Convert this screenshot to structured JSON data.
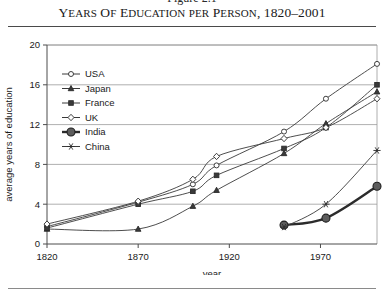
{
  "figure": {
    "number_label": "Figure 2.1",
    "title_main": "Y",
    "title_rest": "EARS OF ",
    "title_full": "YEARS OF EDUCATION PER PERSON, 1820–2001",
    "title_parts": [
      {
        "big": "Y",
        "small": "EARS"
      },
      {
        "big": " O",
        "small": "F"
      },
      {
        "big": " E",
        "small": "DUCATION"
      },
      {
        "big": " ",
        "small": "PER"
      },
      {
        "big": " P",
        "small": "ERSON"
      },
      {
        "big": ", 1820–2001",
        "small": ""
      }
    ]
  },
  "chart_data": {
    "type": "line",
    "title": "Years of Education per Person, 1820–2001",
    "xlabel": "year",
    "ylabel": "average years of education",
    "xlim": [
      1820,
      2001
    ],
    "ylim": [
      0,
      20
    ],
    "xticks": [
      1820,
      1870,
      1920,
      1970
    ],
    "yticks": [
      0,
      4,
      8,
      12,
      16,
      20
    ],
    "grid": "horizontal",
    "legend_position": "upper-left-inside",
    "series": [
      {
        "name": "USA",
        "marker": "open-circle",
        "emphasis": "normal",
        "x": [
          1820,
          1870,
          1900,
          1913,
          1950,
          1973,
          2001
        ],
        "y": [
          1.75,
          4.2,
          6.0,
          7.9,
          11.3,
          14.6,
          18.1
        ]
      },
      {
        "name": "Japan",
        "marker": "filled-triangle",
        "emphasis": "normal",
        "x": [
          1820,
          1870,
          1900,
          1913,
          1950,
          1973,
          2001
        ],
        "y": [
          1.5,
          1.5,
          3.8,
          5.4,
          9.1,
          12.1,
          15.3
        ]
      },
      {
        "name": "France",
        "marker": "filled-square",
        "emphasis": "normal",
        "x": [
          1820,
          1870,
          1900,
          1913,
          1950,
          1973,
          2001
        ],
        "y": [
          1.6,
          4.0,
          5.3,
          6.9,
          9.6,
          11.7,
          16.0
        ]
      },
      {
        "name": "UK",
        "marker": "open-diamond",
        "emphasis": "normal",
        "x": [
          1820,
          1870,
          1900,
          1913,
          1950,
          1973,
          2001
        ],
        "y": [
          2.0,
          4.3,
          6.5,
          8.8,
          10.6,
          11.7,
          14.6
        ]
      },
      {
        "name": "India",
        "marker": "bold-circle",
        "emphasis": "bold",
        "x": [
          1950,
          1973,
          2001
        ],
        "y": [
          1.9,
          2.6,
          5.8
        ]
      },
      {
        "name": "China",
        "marker": "asterisk",
        "emphasis": "normal",
        "x": [
          1950,
          1973,
          2001
        ],
        "y": [
          1.7,
          4.0,
          9.4
        ]
      }
    ]
  },
  "legend": {
    "items": [
      {
        "label": "USA",
        "marker": "open-circle"
      },
      {
        "label": "Japan",
        "marker": "filled-triangle"
      },
      {
        "label": "France",
        "marker": "filled-square"
      },
      {
        "label": "UK",
        "marker": "open-diamond"
      },
      {
        "label": "India",
        "marker": "bold-circle"
      },
      {
        "label": "China",
        "marker": "asterisk"
      }
    ]
  },
  "axes": {
    "x_tick_labels": [
      "1820",
      "1870",
      "1920",
      "1970"
    ],
    "y_tick_labels": [
      "0",
      "4",
      "8",
      "12",
      "16",
      "20"
    ],
    "x_axis_title": "year",
    "y_axis_title": "average years of education"
  },
  "colors": {
    "ink": "#1a1a1a",
    "line": "#3a3a3a",
    "grid": "#9a9a9a",
    "axis": "#4d4d4d",
    "bold_marker": "#5d5d5d",
    "background": "#ffffff"
  }
}
